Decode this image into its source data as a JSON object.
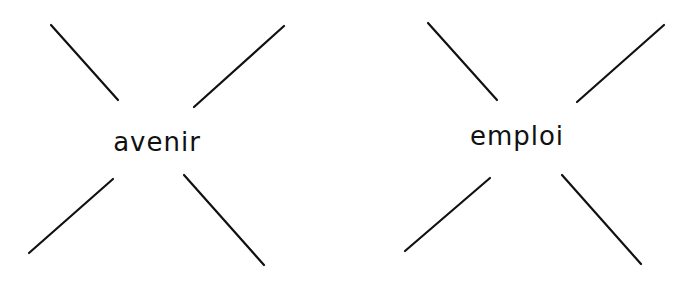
{
  "diagrams": [
    {
      "word": "avenir",
      "center": [
        157,
        142
      ],
      "lines": [
        [
          51,
          25,
          118,
          100
        ],
        [
          284,
          26,
          194,
          107
        ],
        [
          29,
          253,
          113,
          179
        ],
        [
          184,
          175,
          264,
          265
        ]
      ]
    },
    {
      "word": "emploi",
      "center": [
        517,
        136
      ],
      "lines": [
        [
          428,
          23,
          497,
          100
        ],
        [
          664,
          25,
          577,
          102
        ],
        [
          405,
          251,
          490,
          178
        ],
        [
          562,
          175,
          641,
          264
        ]
      ]
    }
  ],
  "colors": {
    "stroke": "#111111",
    "background": "#ffffff"
  }
}
